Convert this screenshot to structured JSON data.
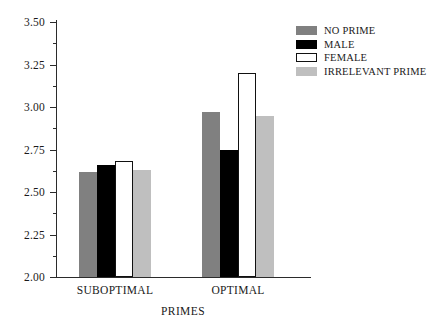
{
  "chart_data": {
    "type": "bar",
    "title": "",
    "xlabel": "PRIMES",
    "ylabel": "",
    "categories": [
      "SUBOPTIMAL",
      "OPTIMAL"
    ],
    "series": [
      {
        "name": "NO PRIME",
        "color": "#808080",
        "values": [
          2.62,
          2.97
        ]
      },
      {
        "name": "MALE",
        "color": "#000000",
        "values": [
          2.66,
          2.75
        ]
      },
      {
        "name": "FEMALE",
        "color": "#ffffff",
        "values": [
          2.68,
          3.2
        ]
      },
      {
        "name": "IRRELEVANT PRIME",
        "color": "#bfbfbf",
        "values": [
          2.63,
          2.95
        ]
      }
    ],
    "ylim": [
      2.0,
      3.5
    ],
    "ytick_labels": [
      "3.50",
      "3.25",
      "3.00",
      "2.75",
      "2.50",
      "2.25",
      "2.00"
    ],
    "ytick_values": [
      3.5,
      3.25,
      3.0,
      2.75,
      2.5,
      2.25,
      2.0
    ],
    "yminor_values": [
      3.375,
      3.125,
      2.875,
      2.625,
      2.375,
      2.125
    ],
    "grid": false,
    "legend_position": "top-right"
  },
  "legend": {
    "items": [
      {
        "label": "NO PRIME"
      },
      {
        "label": "MALE"
      },
      {
        "label": "FEMALE"
      },
      {
        "label": "IRRELEVANT PRIME"
      }
    ]
  },
  "axes": {
    "x_title": "PRIMES",
    "group_labels": [
      "SUBOPTIMAL",
      "OPTIMAL"
    ]
  }
}
